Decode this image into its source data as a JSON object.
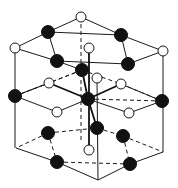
{
  "diagram": {
    "title": "",
    "type": "hexagonal crystal lattice (wurtzite-type structure)",
    "colors": {
      "black_atom": "#111111",
      "white_atom": "#ffffff",
      "line": "#1a1a1a",
      "background": "#ffffff"
    },
    "atom_radius": {
      "black": 6.5,
      "white": 5
    },
    "atoms": [
      {
        "id": "w-top",
        "type": "white",
        "x": 81,
        "y": 17
      },
      {
        "id": "b-top-left",
        "type": "black",
        "x": 48,
        "y": 32
      },
      {
        "id": "b-top-right",
        "type": "black",
        "x": 121,
        "y": 35
      },
      {
        "id": "w-top-left-corner",
        "type": "white",
        "x": 15,
        "y": 48
      },
      {
        "id": "w-top-right-corner",
        "type": "white",
        "x": 163,
        "y": 51
      },
      {
        "id": "w-top-center",
        "type": "white",
        "x": 89,
        "y": 48
      },
      {
        "id": "b-upper-left",
        "type": "black",
        "x": 57,
        "y": 61
      },
      {
        "id": "b-upper-center",
        "type": "black",
        "x": 82,
        "y": 70
      },
      {
        "id": "b-upper-right",
        "type": "black",
        "x": 128,
        "y": 64
      },
      {
        "id": "w-upper-mid",
        "type": "white",
        "x": 97,
        "y": 78
      },
      {
        "id": "w-upper-left",
        "type": "white",
        "x": 49,
        "y": 83
      },
      {
        "id": "w-upper-right",
        "type": "white",
        "x": 121,
        "y": 84
      },
      {
        "id": "b-mid-left-corner",
        "type": "black",
        "x": 15,
        "y": 96
      },
      {
        "id": "b-mid-center",
        "type": "black",
        "x": 88,
        "y": 99
      },
      {
        "id": "b-mid-right-corner",
        "type": "black",
        "x": 162,
        "y": 101
      },
      {
        "id": "w-lower-left",
        "type": "white",
        "x": 57,
        "y": 112
      },
      {
        "id": "w-lower-right",
        "type": "white",
        "x": 129,
        "y": 113
      },
      {
        "id": "b-lower-center",
        "type": "black",
        "x": 97,
        "y": 128
      },
      {
        "id": "b-lower-left",
        "type": "black",
        "x": 48,
        "y": 133
      },
      {
        "id": "b-lower-right",
        "type": "black",
        "x": 123,
        "y": 136
      },
      {
        "id": "w-bottom-center",
        "type": "white",
        "x": 89,
        "y": 150
      },
      {
        "id": "b-bottom-left",
        "type": "black",
        "x": 57,
        "y": 162
      },
      {
        "id": "b-bottom-right",
        "type": "black",
        "x": 130,
        "y": 164
      }
    ],
    "solid_lines": [
      [
        81,
        17,
        48,
        32
      ],
      [
        81,
        17,
        121,
        35
      ],
      [
        48,
        32,
        121,
        35
      ],
      [
        48,
        32,
        15,
        48
      ],
      [
        48,
        32,
        57,
        61
      ],
      [
        121,
        35,
        163,
        51
      ],
      [
        121,
        35,
        128,
        64
      ],
      [
        15,
        48,
        57,
        61
      ],
      [
        57,
        61,
        128,
        64
      ],
      [
        163,
        51,
        128,
        64
      ],
      [
        15,
        48,
        15,
        148
      ],
      [
        163,
        51,
        163,
        152
      ],
      [
        57,
        61,
        82,
        70
      ],
      [
        15,
        96,
        49,
        83
      ],
      [
        15,
        96,
        57,
        112
      ],
      [
        57,
        112,
        88,
        99
      ],
      [
        88,
        99,
        129,
        113
      ],
      [
        129,
        113,
        162,
        101
      ],
      [
        162,
        101,
        121,
        84
      ],
      [
        16,
        148,
        57,
        162
      ],
      [
        57,
        162,
        98,
        180
      ],
      [
        98,
        180,
        130,
        164
      ],
      [
        130,
        164,
        163,
        152
      ],
      [
        97,
        78,
        98,
        180
      ]
    ],
    "bold_lines": [
      [
        82,
        70,
        88,
        99
      ],
      [
        49,
        83,
        88,
        99
      ],
      [
        121,
        84,
        88,
        99
      ],
      [
        88,
        99,
        97,
        128
      ],
      [
        89,
        48,
        89,
        150
      ]
    ],
    "dashed_lines": [
      [
        81,
        17,
        81,
        140
      ],
      [
        15,
        96,
        49,
        83
      ],
      [
        82,
        70,
        49,
        83
      ],
      [
        82,
        70,
        121,
        84
      ],
      [
        121,
        84,
        162,
        101
      ],
      [
        48,
        133,
        97,
        128
      ],
      [
        97,
        128,
        123,
        136
      ],
      [
        48,
        133,
        16,
        148
      ],
      [
        123,
        136,
        163,
        152
      ],
      [
        48,
        133,
        57,
        162
      ],
      [
        123,
        136,
        130,
        164
      ],
      [
        57,
        162,
        130,
        164
      ],
      [
        82,
        70,
        15,
        96
      ],
      [
        88,
        99,
        162,
        101
      ]
    ]
  }
}
